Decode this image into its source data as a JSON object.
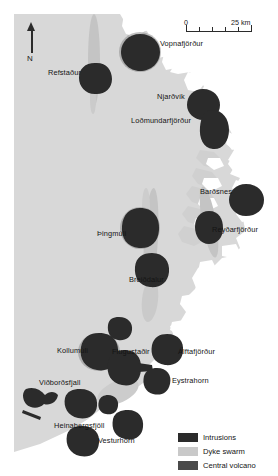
{
  "figure": {
    "type": "map",
    "region": "Eastern Iceland",
    "background_color": "#ffffff",
    "land_color": "#d8d8d8",
    "sea_color": "#ffffff",
    "intrusion_color": "#2b2b2b",
    "dyke_swarm_color": "#c2c2c2",
    "central_volcano_color": "#4a4a4a"
  },
  "north_arrow": {
    "label": "N",
    "icon": "north-arrow-icon"
  },
  "scale_bar": {
    "min_label": "0",
    "max_label": "25 km",
    "length_km": 25,
    "tick_count": 5
  },
  "legend": {
    "items": [
      {
        "label": "Intrusions",
        "color": "#2b2b2b"
      },
      {
        "label": "Dyke swarm",
        "color": "#c9c9c9"
      },
      {
        "label": "Central volcano",
        "color": "#4a4a4a"
      }
    ]
  },
  "labels": [
    {
      "name": "Vopnafjörður",
      "x": 160,
      "y": 44
    },
    {
      "name": "Refstaður",
      "x": 48,
      "y": 73
    },
    {
      "name": "Njarðvík",
      "x": 157,
      "y": 97
    },
    {
      "name": "Loðmundarfjörður",
      "x": 131,
      "y": 121
    },
    {
      "name": "Barðsnes",
      "x": 200,
      "y": 192
    },
    {
      "name": "Þingmúli",
      "x": 97,
      "y": 234
    },
    {
      "name": "Reyðarfjörður",
      "x": 212,
      "y": 230
    },
    {
      "name": "Breiðdalur",
      "x": 129,
      "y": 280
    },
    {
      "name": "Kollumúli",
      "x": 57,
      "y": 351
    },
    {
      "name": "Flugustaðir",
      "x": 112,
      "y": 352
    },
    {
      "name": "Álftafjörður",
      "x": 178,
      "y": 352
    },
    {
      "name": "Eystrahorn",
      "x": 172,
      "y": 381
    },
    {
      "name": "Viðborðsfjall",
      "x": 39,
      "y": 383
    },
    {
      "name": "Heinabergsfjöll",
      "x": 54,
      "y": 426
    },
    {
      "name": "Vesturhorn",
      "x": 98,
      "y": 441
    }
  ],
  "map_data": {
    "intrusions": [
      {
        "name": "Vopnafjörður",
        "cx": 140,
        "cy": 52,
        "rx": 19,
        "ry": 18
      },
      {
        "name": "Refstaður",
        "cx": 95,
        "cy": 78,
        "rx": 16,
        "ry": 15
      },
      {
        "name": "Njarðvík",
        "cx": 203,
        "cy": 104,
        "rx": 16,
        "ry": 15
      },
      {
        "name": "Loðmundarfjörður",
        "cx": 215,
        "cy": 128,
        "rx": 14,
        "ry": 19
      },
      {
        "name": "Barðsnes",
        "cx": 246,
        "cy": 199,
        "rx": 16,
        "ry": 15
      },
      {
        "name": "Reyðarfjörður",
        "cx": 209,
        "cy": 227,
        "rx": 13,
        "ry": 16
      },
      {
        "name": "Þingmúli",
        "cx": 140,
        "cy": 228,
        "rx": 18,
        "ry": 19
      },
      {
        "name": "Breiðdalur",
        "cx": 152,
        "cy": 270,
        "rx": 17,
        "ry": 16
      },
      {
        "name": "Álftafjörður",
        "cx": 167,
        "cy": 349,
        "rx": 15,
        "ry": 15
      },
      {
        "name": "Eystrahorn",
        "cx": 157,
        "cy": 381,
        "rx": 12,
        "ry": 13
      },
      {
        "name": "Kollumúli",
        "cx": 99,
        "cy": 352,
        "rx": 19,
        "ry": 17
      },
      {
        "name": "Flugustaðir",
        "cx": 124,
        "cy": 367,
        "rx": 16,
        "ry": 16
      },
      {
        "name": "unnamed-north",
        "cx": 119,
        "cy": 328,
        "rx": 11,
        "ry": 10
      },
      {
        "name": "Viðborðsfjall",
        "cx": 80,
        "cy": 403,
        "rx": 16,
        "ry": 14
      },
      {
        "name": "Heinabergsfjöll",
        "cx": 108,
        "cy": 403,
        "rx": 8,
        "ry": 8
      },
      {
        "name": "Vesturhorn",
        "cx": 128,
        "cy": 424,
        "rx": 14,
        "ry": 14
      },
      {
        "name": "Hoffell",
        "cx": 82,
        "cy": 440,
        "rx": 16,
        "ry": 14
      }
    ],
    "dyke_swarms": [
      {
        "name": "northern-swarm",
        "cx": 94,
        "cy": 62,
        "rx": 6,
        "ry": 46,
        "rot": 0
      },
      {
        "name": "midfjord-swarm",
        "cx": 151,
        "cy": 237,
        "rx": 7,
        "ry": 50,
        "rot": 2
      },
      {
        "name": "eastern-swarm",
        "cx": 209,
        "cy": 221,
        "rx": 7,
        "ry": 38,
        "rot": -8
      }
    ]
  }
}
